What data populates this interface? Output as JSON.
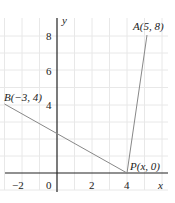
{
  "diagram": {
    "axes": {
      "x_label": "x",
      "y_label": "y"
    },
    "x_ticks": [
      {
        "v": -2,
        "label": "−2"
      },
      {
        "v": 0,
        "label": "0"
      },
      {
        "v": 2,
        "label": "2"
      },
      {
        "v": 4,
        "label": "4"
      }
    ],
    "y_ticks": [
      {
        "v": 4,
        "label": "4"
      },
      {
        "v": 6,
        "label": "6"
      },
      {
        "v": 8,
        "label": "8"
      }
    ],
    "points": {
      "A": {
        "label": "A(5, 8)",
        "x": 5,
        "y": 8
      },
      "B": {
        "label": "B(−3, 4)",
        "x": -3,
        "y": 4
      },
      "P": {
        "label": "P(x, 0)",
        "x": 4,
        "y": 0
      }
    },
    "colors": {
      "grid": "#e6e6e6",
      "axis": "#222222",
      "line": "#888888"
    }
  }
}
